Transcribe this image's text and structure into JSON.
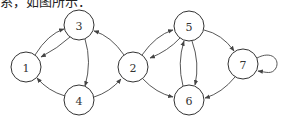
{
  "caption": "系，如图所示：",
  "graph": {
    "type": "directed",
    "nodes": [
      {
        "id": "1",
        "label": "1",
        "x": 26,
        "y": 67
      },
      {
        "id": "2",
        "label": "2",
        "x": 133,
        "y": 67
      },
      {
        "id": "3",
        "label": "3",
        "x": 79,
        "y": 25
      },
      {
        "id": "4",
        "label": "4",
        "x": 79,
        "y": 100
      },
      {
        "id": "5",
        "label": "5",
        "x": 189,
        "y": 26
      },
      {
        "id": "6",
        "label": "6",
        "x": 189,
        "y": 100
      },
      {
        "id": "7",
        "label": "7",
        "x": 243,
        "y": 64
      }
    ],
    "edges": [
      {
        "from": "1",
        "to": "3"
      },
      {
        "from": "3",
        "to": "1"
      },
      {
        "from": "3",
        "to": "4"
      },
      {
        "from": "4",
        "to": "1"
      },
      {
        "from": "4",
        "to": "2"
      },
      {
        "from": "2",
        "to": "3"
      },
      {
        "from": "2",
        "to": "5"
      },
      {
        "from": "5",
        "to": "2"
      },
      {
        "from": "2",
        "to": "6"
      },
      {
        "from": "5",
        "to": "6"
      },
      {
        "from": "6",
        "to": "5"
      },
      {
        "from": "5",
        "to": "7"
      },
      {
        "from": "7",
        "to": "6"
      },
      {
        "from": "7",
        "to": "7"
      }
    ]
  }
}
